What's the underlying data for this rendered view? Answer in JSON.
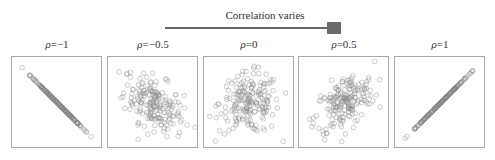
{
  "slider": {
    "title": "Correlation varies",
    "track_color": "#666666",
    "thumb_color": "#6a6a6a"
  },
  "chart_data": [
    {
      "type": "scatter",
      "title": "ρ=−1",
      "rho": -1,
      "symbol": "ρ",
      "value_label": "=−1",
      "xlabel": "",
      "ylabel": "",
      "grid": false,
      "marker": "open-circle",
      "n_points": 200
    },
    {
      "type": "scatter",
      "title": "ρ=−0.5",
      "rho": -0.5,
      "symbol": "ρ",
      "value_label": "=−0.5",
      "xlabel": "",
      "ylabel": "",
      "grid": false,
      "marker": "open-circle",
      "n_points": 200
    },
    {
      "type": "scatter",
      "title": "ρ=0",
      "rho": 0,
      "symbol": "ρ",
      "value_label": "=0",
      "xlabel": "",
      "ylabel": "",
      "grid": false,
      "marker": "open-circle",
      "n_points": 200
    },
    {
      "type": "scatter",
      "title": "ρ=0.5",
      "rho": 0.5,
      "symbol": "ρ",
      "value_label": "=0.5",
      "xlabel": "",
      "ylabel": "",
      "grid": false,
      "marker": "open-circle",
      "n_points": 200
    },
    {
      "type": "scatter",
      "title": "ρ=1",
      "rho": 1,
      "symbol": "ρ",
      "value_label": "=1",
      "xlabel": "",
      "ylabel": "",
      "grid": false,
      "marker": "open-circle",
      "n_points": 200
    }
  ],
  "panels": [
    {
      "left": 11
    },
    {
      "left": 107
    },
    {
      "left": 203
    },
    {
      "left": 298
    },
    {
      "left": 394
    }
  ]
}
